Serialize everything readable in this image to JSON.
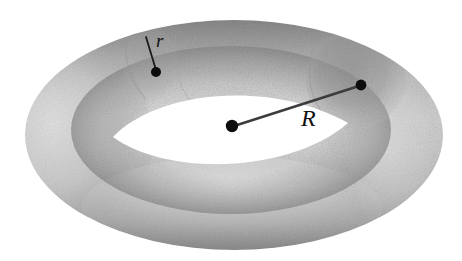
{
  "figure": {
    "type": "geometric-solid-diagram",
    "shape": "torus",
    "background_color": "#ffffff",
    "ink_color": "#111111",
    "shading": "grayscale stipple / airbrush",
    "labels": {
      "minor_radius": "r",
      "major_radius": "R"
    },
    "annotations": [
      {
        "name": "minor-radius-leader",
        "label": "r",
        "label_position": [
          156,
          31
        ],
        "line_from": [
          146,
          37
        ],
        "line_to": [
          156,
          72
        ],
        "endpoint_dot": [
          156,
          72
        ],
        "dot_radius": 5
      },
      {
        "name": "major-radius-leader",
        "label": "R",
        "label_position": [
          301,
          106
        ],
        "line_from": [
          232,
          126
        ],
        "line_to": [
          361,
          85
        ],
        "start_dot": [
          232,
          126
        ],
        "endpoint_dot": [
          361,
          85
        ],
        "dot_radius": 6
      }
    ],
    "geometry": {
      "outer_ellipse": {
        "cx": 234,
        "cy": 135,
        "rx": 209,
        "ry": 115
      },
      "inner_hole": {
        "left_tip": [
          113,
          137
        ],
        "right_tip": [
          348,
          123
        ],
        "top_sag": 95,
        "bottom_sag": 167,
        "fill": "#ffffff"
      },
      "cross_section_patch": {
        "cx": 356,
        "cy": 80,
        "rx": 48,
        "ry": 48,
        "note": "darker circular tube cross-section on the right"
      }
    },
    "palette": {
      "lightest": "#f4f4f4",
      "light": "#d9d9d9",
      "mid": "#b8b8b8",
      "dark": "#9a9a9a",
      "darkest": "#7c7c7c",
      "line": "#3a3a3a",
      "dot": "#111111"
    }
  }
}
